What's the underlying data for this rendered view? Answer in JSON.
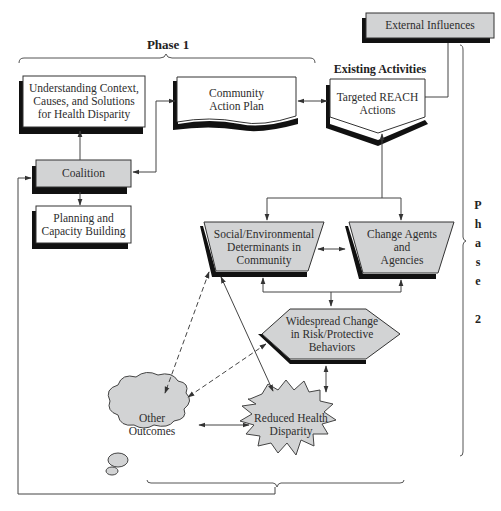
{
  "diagram": {
    "phase1_label": "Phase 1",
    "phase2_label": [
      "P",
      "h",
      "a",
      "s",
      "e",
      "",
      "2"
    ],
    "existing_activities_label": "Existing Activities",
    "nodes": {
      "external_influences": "External Influences",
      "understanding": [
        "Understanding Context,",
        "Causes, and Solutions",
        "for Health Disparity"
      ],
      "community_action_plan": [
        "Community",
        "Action Plan"
      ],
      "targeted_reach": [
        "Targeted REACH",
        "Actions"
      ],
      "coalition": "Coalition",
      "planning": [
        "Planning and",
        "Capacity Building"
      ],
      "social_env": [
        "Social/Environmental",
        "Determinants in",
        "Community"
      ],
      "change_agents": [
        "Change Agents",
        "and",
        "Agencies"
      ],
      "widespread_change": [
        "Widespread Change",
        "in Risk/Protective",
        "Behaviors"
      ],
      "other_outcomes": [
        "Other",
        "Outcomes"
      ],
      "reduced_disparity": [
        "Reduced Health",
        "Disparity"
      ]
    },
    "colors": {
      "gray_fill": "#d2d3d4",
      "shadow": "#111111",
      "line": "#3a3a3a"
    }
  }
}
